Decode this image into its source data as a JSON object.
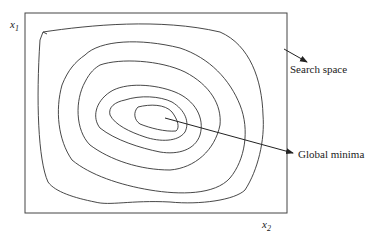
{
  "diagram": {
    "axes": {
      "y_label": "x",
      "y_label_sub": "1",
      "x_label": "x",
      "x_label_sub": "2"
    },
    "annotations": {
      "search_space": "Search space",
      "global_minima": "Global minima"
    },
    "colors": {
      "stroke": "#333333",
      "background": "#ffffff"
    },
    "contour_count": 6
  }
}
